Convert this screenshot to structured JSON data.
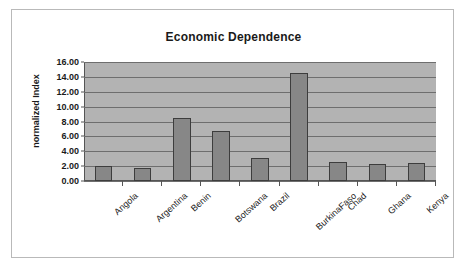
{
  "chart_data": {
    "type": "bar",
    "title": "Economic Dependence",
    "xlabel": "",
    "ylabel": "normalized Index",
    "categories": [
      "Angola",
      "Argentina",
      "Benin",
      "Botswana",
      "Brazil",
      "BurkinaFaso",
      "Chad",
      "Ghana",
      "Kenya"
    ],
    "values": [
      2.0,
      1.7,
      8.5,
      6.7,
      3.1,
      14.5,
      2.5,
      2.35,
      2.4
    ],
    "ylim": [
      0.0,
      16.0
    ],
    "ytick_step": 2.0,
    "ytick_labels": [
      "0.00",
      "2.00",
      "4.00",
      "6.00",
      "8.00",
      "10.00",
      "12.00",
      "14.00",
      "16.00"
    ],
    "ytick_values": [
      0,
      2,
      4,
      6,
      8,
      10,
      12,
      14,
      16
    ],
    "grid": true,
    "legend": "none",
    "series": [
      {
        "name": "normalized Index",
        "values": [
          2.0,
          1.7,
          8.5,
          6.7,
          3.1,
          14.5,
          2.5,
          2.35,
          2.4
        ]
      }
    ],
    "colors": {
      "bar_fill": "#878787",
      "bar_border": "#3d3d3d",
      "plot_background": "#b3b3b3",
      "gridline": "#6e6e6e",
      "axis": "#555555",
      "text": "#1a1a1a",
      "frame_border": "#b9b9b9",
      "page_background": "#ffffff"
    }
  }
}
